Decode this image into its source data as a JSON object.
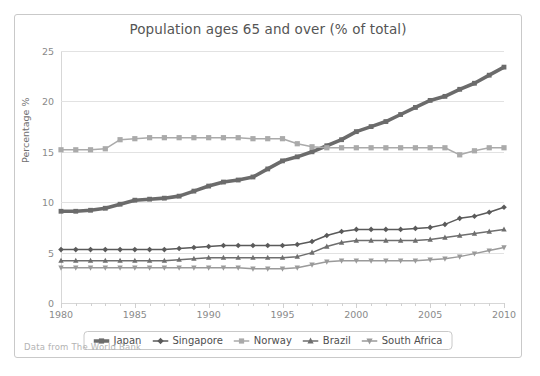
{
  "chart_data": {
    "type": "line",
    "title": "Population ages 65 and over (% of total)",
    "xlabel": "",
    "ylabel": "Percentage %",
    "xlim": [
      1980,
      2010
    ],
    "ylim": [
      0,
      25
    ],
    "yticks": [
      0,
      5,
      10,
      15,
      20,
      25
    ],
    "xticks": [
      1980,
      1985,
      1990,
      1995,
      2000,
      2005,
      2010
    ],
    "grid": true,
    "legend_position": "bottom",
    "source_note": "Data from The World Bank",
    "x": [
      1980,
      1981,
      1982,
      1983,
      1984,
      1985,
      1986,
      1987,
      1988,
      1989,
      1990,
      1991,
      1992,
      1993,
      1994,
      1995,
      1996,
      1997,
      1998,
      1999,
      2000,
      2001,
      2002,
      2003,
      2004,
      2005,
      2006,
      2007,
      2008,
      2009,
      2010
    ],
    "series": [
      {
        "name": "Japan",
        "color": "#6b6b6b",
        "marker": "square",
        "values": [
          9.1,
          9.1,
          9.2,
          9.4,
          9.8,
          10.2,
          10.3,
          10.4,
          10.6,
          11.1,
          11.6,
          12.0,
          12.2,
          12.5,
          13.3,
          14.1,
          14.5,
          15.0,
          15.6,
          16.2,
          17.0,
          17.5,
          18.0,
          18.7,
          19.4,
          20.1,
          20.5,
          21.2,
          21.8,
          22.6,
          23.4
        ]
      },
      {
        "name": "Singapore",
        "color": "#5a5a5a",
        "marker": "diamond",
        "values": [
          5.3,
          5.3,
          5.3,
          5.3,
          5.3,
          5.3,
          5.3,
          5.3,
          5.4,
          5.5,
          5.6,
          5.7,
          5.7,
          5.7,
          5.7,
          5.7,
          5.8,
          6.1,
          6.7,
          7.1,
          7.3,
          7.3,
          7.3,
          7.3,
          7.4,
          7.5,
          7.8,
          8.4,
          8.6,
          9.0,
          9.5
        ]
      },
      {
        "name": "Norway",
        "color": "#aaaaaa",
        "marker": "square",
        "values": [
          15.2,
          15.2,
          15.2,
          15.3,
          16.2,
          16.3,
          16.4,
          16.4,
          16.4,
          16.4,
          16.4,
          16.4,
          16.4,
          16.3,
          16.3,
          16.3,
          15.8,
          15.5,
          15.4,
          15.4,
          15.4,
          15.4,
          15.4,
          15.4,
          15.4,
          15.4,
          15.4,
          14.7,
          15.1,
          15.4,
          15.4
        ]
      },
      {
        "name": "Brazil",
        "color": "#6e6e6e",
        "marker": "triangle",
        "values": [
          4.2,
          4.2,
          4.2,
          4.2,
          4.2,
          4.2,
          4.2,
          4.2,
          4.3,
          4.4,
          4.5,
          4.5,
          4.5,
          4.5,
          4.5,
          4.5,
          4.6,
          5.0,
          5.6,
          6.0,
          6.2,
          6.2,
          6.2,
          6.2,
          6.2,
          6.3,
          6.5,
          6.7,
          6.9,
          7.1,
          7.3
        ]
      },
      {
        "name": "South Africa",
        "color": "#9a9a9a",
        "marker": "triangle-down",
        "values": [
          3.5,
          3.5,
          3.5,
          3.5,
          3.5,
          3.5,
          3.5,
          3.5,
          3.5,
          3.5,
          3.5,
          3.5,
          3.5,
          3.4,
          3.4,
          3.4,
          3.5,
          3.8,
          4.1,
          4.2,
          4.2,
          4.2,
          4.2,
          4.2,
          4.2,
          4.3,
          4.4,
          4.6,
          4.9,
          5.2,
          5.5
        ]
      }
    ]
  },
  "footer": {
    "note": "Data from The World Bank"
  }
}
